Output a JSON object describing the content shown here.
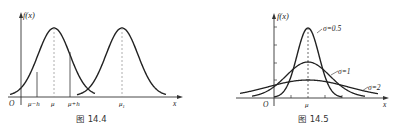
{
  "chart_data": [
    {
      "type": "line",
      "title": "图 14.4",
      "caption": "图 14.4",
      "ylabel": "f(x)",
      "xlabel": "x",
      "origin_label": "O",
      "tick_labels": [
        "μ−h",
        "μ",
        "μ+h",
        "μ₁"
      ],
      "series": [
        {
          "name": "N(μ, σ²)",
          "mean_label": "μ",
          "shape": "normal density"
        },
        {
          "name": "N(μ₁, σ²)",
          "mean_label": "μ₁",
          "shape": "normal density, same σ, shifted right"
        }
      ],
      "annotations": [
        "dashed vertical line at μ",
        "dashed vertical line at μ₁",
        "solid vertical lines at μ−h and μ+h"
      ],
      "grid": false
    },
    {
      "type": "line",
      "title": "图 14.5",
      "caption": "图 14.5",
      "ylabel": "f(x)",
      "xlabel": "x",
      "origin_label": "O",
      "tick_labels": [
        "μ"
      ],
      "series": [
        {
          "name": "σ=0.5",
          "sigma": 0.5
        },
        {
          "name": "σ=1",
          "sigma": 1
        },
        {
          "name": "σ=2",
          "sigma": 2
        }
      ],
      "annotations": [
        "dashed vertical line at μ"
      ],
      "grid": false
    }
  ],
  "fig1": {
    "ylabel": "f(x)",
    "origin": "O",
    "xlabel": "x",
    "ticks": {
      "mu_minus_h": "μ−h",
      "mu": "μ",
      "mu_plus_h": "μ+h",
      "mu1": "μ"
    },
    "mu1_sub": "1",
    "caption": "图 14.4"
  },
  "fig2": {
    "ylabel": "f(x)",
    "origin": "O",
    "xlabel": "x",
    "mu": "μ",
    "s05": "σ=0.5",
    "s1": "σ=1",
    "s2": "σ=2",
    "caption": "图 14.5"
  }
}
